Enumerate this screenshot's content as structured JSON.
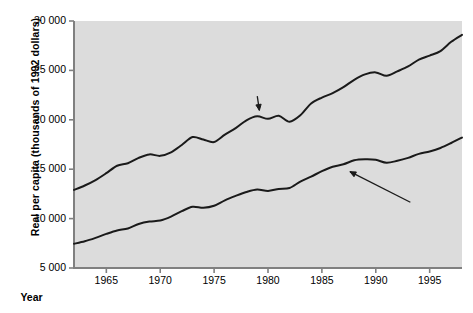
{
  "figure": {
    "background_color": "#ffffff",
    "plot_background_color": "#dcdcdc",
    "line_color": "#1a1a1a",
    "axis_color": "#808080"
  },
  "chart_data": {
    "type": "line",
    "title": "",
    "xlabel": "Year",
    "ylabel": "Real per capita (thousands of 1992 dollars)",
    "xlim": [
      1962,
      1998
    ],
    "ylim": [
      5000,
      30000
    ],
    "grid": false,
    "legend_position": "inline-annotations",
    "xticks": [
      1965,
      1970,
      1975,
      1980,
      1985,
      1990,
      1995
    ],
    "xticklabels": [
      "1965",
      "1970",
      "1975",
      "1980",
      "1985",
      "1990",
      "1995"
    ],
    "yticks": [
      5000,
      10000,
      15000,
      20000,
      25000,
      30000
    ],
    "yticklabels": [
      "5 000",
      "10 000",
      "15 000",
      "20 000",
      "25 000",
      "30 000"
    ],
    "x": [
      1962,
      1963,
      1964,
      1965,
      1966,
      1967,
      1968,
      1969,
      1970,
      1971,
      1972,
      1973,
      1974,
      1975,
      1976,
      1977,
      1978,
      1979,
      1980,
      1981,
      1982,
      1983,
      1984,
      1985,
      1986,
      1987,
      1988,
      1989,
      1990,
      1991,
      1992,
      1993,
      1994,
      1995,
      1996,
      1997,
      1998
    ],
    "series": [
      {
        "name": "GDP",
        "values": [
          12900,
          13350,
          13900,
          14600,
          15350,
          15600,
          16150,
          16500,
          16350,
          16700,
          17450,
          18250,
          18000,
          17750,
          18500,
          19150,
          19950,
          20350,
          20100,
          20400,
          19800,
          20450,
          21650,
          22250,
          22700,
          23300,
          24050,
          24600,
          24800,
          24450,
          24900,
          25400,
          26100,
          26500,
          26950,
          27900,
          28600
        ]
      },
      {
        "name": "Consumption spending",
        "values": [
          7450,
          7700,
          8050,
          8450,
          8800,
          9000,
          9450,
          9700,
          9800,
          10200,
          10750,
          11200,
          11100,
          11300,
          11850,
          12300,
          12700,
          12950,
          12800,
          13000,
          13100,
          13750,
          14250,
          14800,
          15250,
          15500,
          15900,
          16000,
          15950,
          15650,
          15850,
          16150,
          16550,
          16800,
          17150,
          17650,
          18200
        ]
      }
    ],
    "annotations": [
      {
        "label": "GDP",
        "text_x": 1976.5,
        "text_y": 22200,
        "points_to_x": 1979.2,
        "points_to_y": 20950
      },
      {
        "label": "Consumption spending",
        "text_x": 1983.0,
        "text_y": 11250,
        "points_to_x": 1987.6,
        "points_to_y": 14750
      }
    ]
  }
}
